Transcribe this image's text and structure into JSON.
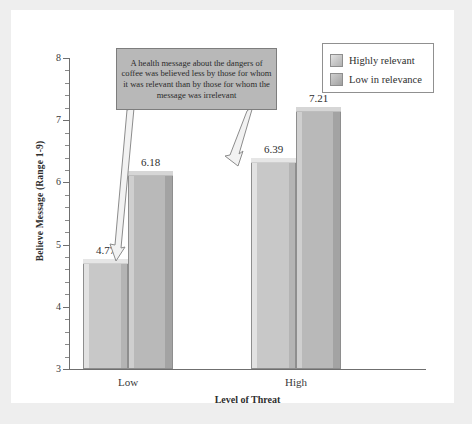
{
  "figure": {
    "background_color": "#eeeeee",
    "card_color": "#ffffff"
  },
  "annotation": {
    "text": "A health message about the dangers of coffee was believed less by those for whom it was relevant than by those for whom the message was irrelevant",
    "box_fill": "#b8b8b8",
    "box_border": "#7d7d7d",
    "arrows": [
      {
        "name": "arrow-to-low-highly-relevant",
        "target": "4.77 bar"
      },
      {
        "name": "arrow-to-high-highly-relevant",
        "target": "6.39 bar"
      }
    ]
  },
  "legend": {
    "position": "top-right",
    "entries": [
      {
        "label": "Highly relevant",
        "color": "#c6c6c6"
      },
      {
        "label": "Low in relevance",
        "color": "#b6b6b6"
      }
    ]
  },
  "chart_data": {
    "type": "bar",
    "title": "",
    "subtitle": "",
    "xlabel": "Level of Threat",
    "ylabel": "Believe Message (Range 1-9)",
    "categories": [
      "Low",
      "High"
    ],
    "series": [
      {
        "name": "Highly relevant",
        "values": [
          4.77,
          6.39
        ],
        "color": "#c6c6c6"
      },
      {
        "name": "Low in relevance",
        "values": [
          6.18,
          7.21
        ],
        "color": "#b6b6b6"
      }
    ],
    "ylim": [
      3,
      8
    ],
    "yticks": [
      3,
      4,
      5,
      6,
      7,
      8
    ],
    "ytick_labels": [
      "3",
      "4",
      "5",
      "6",
      "7",
      "8"
    ],
    "minor_ticks_per_interval": 4,
    "grid": false,
    "legend_position": "upper right",
    "data_labels": [
      "4.77",
      "6.18",
      "6.39",
      "7.21"
    ],
    "annotations": [
      "A health message about the dangers of coffee was believed less by those for whom it was relevant than by those for whom the message was irrelevant"
    ]
  }
}
